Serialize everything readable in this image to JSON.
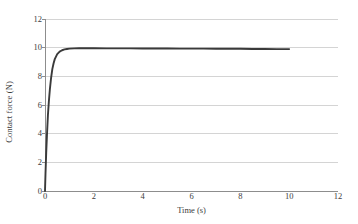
{
  "chart_data": {
    "type": "line",
    "title": "",
    "subtitle": "",
    "xlabel": "Time (s)",
    "ylabel": "Contact force (N)",
    "xlim": [
      0,
      12
    ],
    "ylim": [
      0,
      12
    ],
    "xticks": [
      0,
      2,
      4,
      6,
      8,
      10,
      12
    ],
    "yticks": [
      0,
      2,
      4,
      6,
      8,
      10,
      12
    ],
    "xtick_labels": [
      "0",
      "2",
      "4",
      "6",
      "8",
      "10",
      "12"
    ],
    "ytick_labels": [
      "0",
      "2",
      "4",
      "6",
      "8",
      "10",
      "12"
    ],
    "grid": "horizontal",
    "legend": "none",
    "series": [
      {
        "name": "Contact force",
        "color": "#3a3a3a",
        "line_width": 1.9,
        "x": [
          0.0,
          0.02,
          0.05,
          0.08,
          0.12,
          0.16,
          0.2,
          0.25,
          0.3,
          0.35,
          0.4,
          0.5,
          0.6,
          0.7,
          0.8,
          0.9,
          1.0,
          1.2,
          1.4,
          1.6,
          1.8,
          2.0,
          2.5,
          3.0,
          3.5,
          4.0,
          4.5,
          5.0,
          5.5,
          6.0,
          6.5,
          7.0,
          7.5,
          8.0,
          8.5,
          9.0,
          9.5,
          10.0
        ],
        "y": [
          0.0,
          1.2,
          2.7,
          3.9,
          5.3,
          6.3,
          7.1,
          7.9,
          8.5,
          8.9,
          9.2,
          9.55,
          9.73,
          9.82,
          9.88,
          9.91,
          9.93,
          9.95,
          9.96,
          9.96,
          9.96,
          9.96,
          9.95,
          9.95,
          9.95,
          9.94,
          9.94,
          9.94,
          9.93,
          9.93,
          9.93,
          9.92,
          9.92,
          9.92,
          9.91,
          9.91,
          9.9,
          9.9
        ]
      }
    ],
    "annotations": [],
    "steady_state_value": 9.9,
    "rise_time_s": 1.0,
    "data_end_time_s": 10.0
  },
  "axes": {
    "y_title": "Contact force (N)",
    "x_title": "Time (s)",
    "grid_color": "#c9c9c9",
    "axis_color": "#8d8d8d",
    "series_color": "#3a3a3a",
    "background": "#ffffff"
  }
}
